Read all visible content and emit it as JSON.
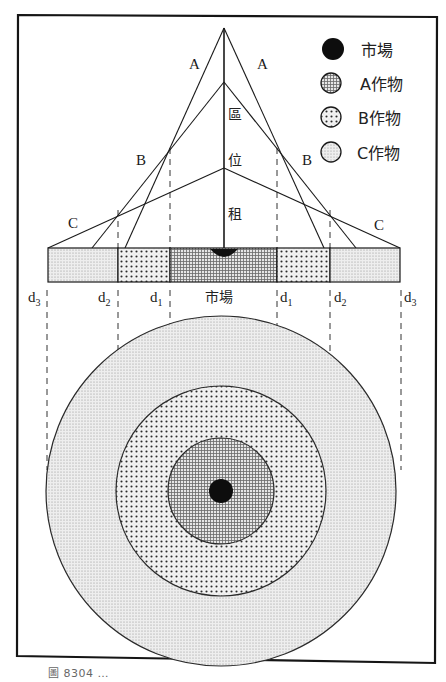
{
  "legend": {
    "items": [
      {
        "key": "market",
        "label": "市場",
        "pattern": "solid-black"
      },
      {
        "key": "crop_a",
        "label": "A作物",
        "pattern": "fine-grid"
      },
      {
        "key": "crop_b",
        "label": "B作物",
        "pattern": "coarse-dots"
      },
      {
        "key": "crop_c",
        "label": "C作物",
        "pattern": "fine-dots"
      }
    ]
  },
  "bid_rent": {
    "axis_label_chars": [
      "區",
      "位",
      "租"
    ],
    "line_labels": {
      "a_left": "A",
      "a_right": "A",
      "b_left": "B",
      "b_right": "B",
      "c_left": "C",
      "c_right": "C"
    }
  },
  "distance_bar": {
    "center_label": "市場",
    "markers": [
      {
        "base": "d",
        "sub": "3"
      },
      {
        "base": "d",
        "sub": "2"
      },
      {
        "base": "d",
        "sub": "1"
      },
      {
        "base": "d",
        "sub": "1"
      },
      {
        "base": "d",
        "sub": "2"
      },
      {
        "base": "d",
        "sub": "3"
      }
    ]
  },
  "rings": {
    "inner": "A作物",
    "middle": "B作物",
    "outer": "C作物",
    "center": "市場"
  },
  "caption": "圖 8304 …"
}
